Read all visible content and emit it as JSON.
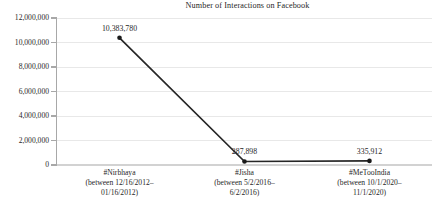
{
  "chart_data": {
    "type": "line",
    "title": "Number of Interactions on Facebook",
    "xlabel": "",
    "ylabel": "",
    "grid": true,
    "legend": "none",
    "ylim": [
      0,
      12000000
    ],
    "ytick_labels": [
      "12,000,000",
      "10,000,000",
      "8,000,000",
      "6,000,000",
      "4,000,000",
      "2,000,000",
      "0"
    ],
    "ytick_values": [
      12000000,
      10000000,
      8000000,
      6000000,
      4000000,
      2000000,
      0
    ],
    "categories": [
      "#Nirbhaya",
      "#Jisha",
      "#MeTooIndia"
    ],
    "category_lines": [
      [
        "#Nirbhaya",
        "(between 12/16/2012–",
        "01/16/2012)"
      ],
      [
        "#Jisha",
        "(between 5/2/2016–",
        "6/2/2016)"
      ],
      [
        "#MeTooIndia",
        "(between 10/1/2020–",
        "11/1/2020)"
      ]
    ],
    "values": [
      10383780,
      287898,
      335912
    ],
    "value_labels": [
      "10,383,780",
      "287,898",
      "335,912"
    ],
    "series": [
      {
        "name": "Number of Interactions on Facebook",
        "values": [
          10383780,
          287898,
          335912
        ]
      }
    ],
    "colors": {
      "line": "#262626",
      "marker": "#1a1a1a",
      "grid": "#e8e8e8",
      "axis": "#a8a8a8",
      "text": "#1f1f1f",
      "background": "#ffffff"
    }
  }
}
